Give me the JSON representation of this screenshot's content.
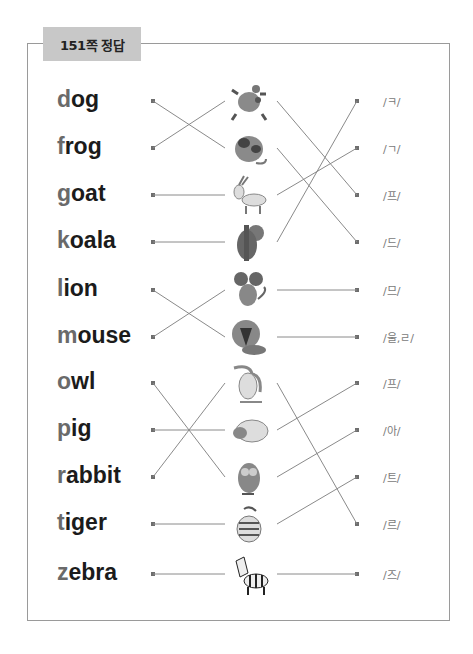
{
  "header": {
    "title": "151쪽 정답"
  },
  "rows": [
    {
      "word": "dog",
      "first": "d",
      "rest": "og",
      "y": 101,
      "animal": "frog",
      "pron": "/ㅋ/"
    },
    {
      "word": "frog",
      "first": "f",
      "rest": "rog",
      "y": 148,
      "animal": "dog",
      "pron": "/ㄱ/"
    },
    {
      "word": "goat",
      "first": "g",
      "rest": "oat",
      "y": 195,
      "animal": "goat",
      "pron": "/프/"
    },
    {
      "word": "koala",
      "first": "k",
      "rest": "oala",
      "y": 242,
      "animal": "koala",
      "pron": "/드/"
    },
    {
      "word": "lion",
      "first": "l",
      "rest": "ion",
      "y": 290,
      "animal": "mouse",
      "pron": "/므/"
    },
    {
      "word": "mouse",
      "first": "m",
      "rest": "ouse",
      "y": 337,
      "animal": "lion",
      "pron": "/울,ㄹ/"
    },
    {
      "word": "owl",
      "first": "o",
      "rest": "wl",
      "y": 383,
      "animal": "rabbit",
      "pron": "/프/"
    },
    {
      "word": "pig",
      "first": "p",
      "rest": "ig",
      "y": 430,
      "animal": "pig",
      "pron": "/아/"
    },
    {
      "word": "rabbit",
      "first": "r",
      "rest": "abbit",
      "y": 477,
      "animal": "owl",
      "pron": "/트/"
    },
    {
      "word": "tiger",
      "first": "t",
      "rest": "iger",
      "y": 524,
      "animal": "tiger",
      "pron": "/르/"
    },
    {
      "word": "zebra",
      "first": "z",
      "rest": "ebra",
      "y": 574,
      "animal": "zebra",
      "pron": "/즈/"
    }
  ],
  "left_links": [
    [
      0,
      1
    ],
    [
      1,
      0
    ],
    [
      2,
      2
    ],
    [
      3,
      3
    ],
    [
      4,
      5
    ],
    [
      5,
      4
    ],
    [
      6,
      8
    ],
    [
      7,
      7
    ],
    [
      8,
      6
    ],
    [
      9,
      9
    ],
    [
      10,
      10
    ]
  ],
  "right_links": [
    [
      0,
      2
    ],
    [
      1,
      3
    ],
    [
      2,
      1
    ],
    [
      3,
      0
    ],
    [
      4,
      4
    ],
    [
      5,
      5
    ],
    [
      6,
      9
    ],
    [
      7,
      6
    ],
    [
      8,
      7
    ],
    [
      9,
      8
    ],
    [
      10,
      10
    ]
  ],
  "colors": {
    "line": "#8a8a8a",
    "dot": "#6e6e6e",
    "tab": "#c8c8c8",
    "frame": "#9a9a9a"
  }
}
